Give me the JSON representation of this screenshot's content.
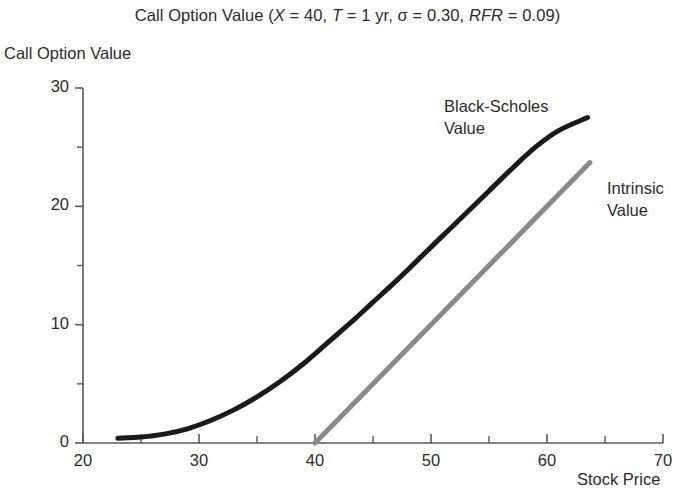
{
  "chart_data": {
    "type": "line",
    "title": "Call Option Value (X = 40, T = 1 yr, σ = 0.30, RFR = 0.09)",
    "title_parts": {
      "lead": "Call Option Value (",
      "x_sym": "X",
      "x_val": " = 40, ",
      "t_sym": "T",
      "t_val": " = 1 yr, σ = 0.30, ",
      "rfr_sym": "RFR",
      "rfr_val": " = 0.09)"
    },
    "xlabel": "Stock Price",
    "ylabel": "Call Option Value",
    "xlim": [
      20,
      70
    ],
    "ylim": [
      0,
      30
    ],
    "grid": false,
    "legend_position": "inline-annotation",
    "x_major_ticks": [
      20,
      30,
      40,
      50,
      60,
      70
    ],
    "x_minor_ticks": [
      25,
      35,
      45,
      55,
      65
    ],
    "y_major_ticks": [
      0,
      10,
      20,
      30
    ],
    "y_minor_ticks": [
      5,
      15,
      25
    ],
    "x_tick_labels": [
      "20",
      "30",
      "40",
      "50",
      "60",
      "70"
    ],
    "y_tick_labels": [
      "0",
      "10",
      "20",
      "30"
    ],
    "series": [
      {
        "name": "Black-Scholes Value",
        "label_line1": "Black-Scholes",
        "label_line2": "Value",
        "color": "#1a1a1a",
        "width": 5.0,
        "x": [
          23,
          25,
          27,
          29,
          31,
          33,
          35,
          37,
          39,
          41,
          43,
          45,
          47,
          49,
          51,
          53,
          55,
          57,
          59,
          61,
          63.5
        ],
        "y": [
          0.4,
          0.5,
          0.75,
          1.2,
          1.9,
          2.8,
          3.9,
          5.2,
          6.7,
          8.4,
          10.1,
          11.9,
          13.7,
          15.6,
          17.5,
          19.4,
          21.3,
          23.2,
          25.0,
          26.4,
          27.5
        ]
      },
      {
        "name": "Intrinsic Value",
        "label_line1": "Intrinsic",
        "label_line2": "Value",
        "color": "#8a8a8a",
        "width": 5.0,
        "x": [
          40,
          63.7
        ],
        "y": [
          0,
          23.7
        ]
      }
    ]
  },
  "axes": {
    "origin_px": [
      83,
      443
    ],
    "x_end_px": [
      663,
      443
    ],
    "y_top_px": [
      83,
      88
    ],
    "axis_color": "#56585a"
  }
}
